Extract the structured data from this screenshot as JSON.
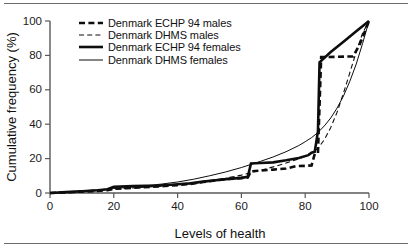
{
  "chart_data": {
    "type": "line",
    "title": "",
    "subtitle": "",
    "xlabel": "Levels of health",
    "ylabel": "Cumulative frequency (%)",
    "xlim": [
      0,
      100
    ],
    "ylim": [
      0,
      100
    ],
    "xticks": [
      0,
      20,
      40,
      60,
      80,
      100
    ],
    "yticks": [
      0,
      20,
      40,
      60,
      80,
      100
    ],
    "grid": false,
    "legend_position": "top-left",
    "colors": {
      "ink": "#0d0d0d",
      "axis": "#595959",
      "background": "#ffffff",
      "rule": "#6b6b6b"
    },
    "series": [
      {
        "name": "Denmark ECHP 94 males",
        "style": "thick-dashed",
        "linewidth": 2.6,
        "dash": "6 3.4",
        "points": [
          [
            0,
            0
          ],
          [
            5,
            0.4
          ],
          [
            10,
            0.8
          ],
          [
            15,
            1.2
          ],
          [
            18,
            1.6
          ],
          [
            20,
            2.4
          ],
          [
            24,
            2.8
          ],
          [
            28,
            3.2
          ],
          [
            32,
            3.6
          ],
          [
            36,
            4.1
          ],
          [
            40,
            4.6
          ],
          [
            44,
            5.2
          ],
          [
            48,
            6.4
          ],
          [
            52,
            7.4
          ],
          [
            55,
            8.0
          ],
          [
            58,
            8.4
          ],
          [
            62,
            9.0
          ],
          [
            63,
            12.6
          ],
          [
            66,
            13.0
          ],
          [
            70,
            13.6
          ],
          [
            74,
            14.2
          ],
          [
            77,
            15.6
          ],
          [
            80,
            15.8
          ],
          [
            82,
            16.0
          ],
          [
            83,
            22.8
          ],
          [
            84,
            23.2
          ],
          [
            85,
            79.0
          ],
          [
            90,
            79.2
          ],
          [
            95,
            79.4
          ],
          [
            97,
            86.0
          ],
          [
            100,
            100
          ]
        ]
      },
      {
        "name": "Denmark DHMS males",
        "style": "thin-dashed",
        "linewidth": 1.1,
        "dash": "5 3.2",
        "points": [
          [
            0,
            0
          ],
          [
            5,
            0.5
          ],
          [
            10,
            1.0
          ],
          [
            15,
            1.5
          ],
          [
            20,
            2.2
          ],
          [
            25,
            2.8
          ],
          [
            30,
            3.4
          ],
          [
            35,
            4.0
          ],
          [
            40,
            4.8
          ],
          [
            45,
            6.0
          ],
          [
            50,
            7.2
          ],
          [
            55,
            8.6
          ],
          [
            60,
            10.4
          ],
          [
            63,
            11.8
          ],
          [
            66,
            13.2
          ],
          [
            70,
            15.2
          ],
          [
            74,
            17.4
          ],
          [
            78,
            19.8
          ],
          [
            80,
            21.4
          ],
          [
            82,
            23.4
          ],
          [
            84,
            26.0
          ],
          [
            86,
            31.0
          ],
          [
            88,
            38.0
          ],
          [
            90,
            47.0
          ],
          [
            92,
            58.0
          ],
          [
            94,
            70.0
          ],
          [
            96,
            82.0
          ],
          [
            98,
            93.0
          ],
          [
            100,
            100
          ]
        ]
      },
      {
        "name": "Denmark ECHP 94 females",
        "style": "thick-solid",
        "linewidth": 2.6,
        "dash": "",
        "points": [
          [
            0,
            0
          ],
          [
            5,
            0.5
          ],
          [
            10,
            1.0
          ],
          [
            15,
            1.6
          ],
          [
            18,
            2.2
          ],
          [
            20,
            3.6
          ],
          [
            22,
            3.8
          ],
          [
            26,
            4.0
          ],
          [
            30,
            4.2
          ],
          [
            34,
            4.4
          ],
          [
            38,
            4.8
          ],
          [
            41,
            5.2
          ],
          [
            44,
            5.6
          ],
          [
            48,
            6.6
          ],
          [
            52,
            7.4
          ],
          [
            56,
            8.2
          ],
          [
            60,
            8.8
          ],
          [
            62,
            9.4
          ],
          [
            63,
            17.2
          ],
          [
            66,
            17.4
          ],
          [
            70,
            17.8
          ],
          [
            74,
            19.0
          ],
          [
            78,
            20.4
          ],
          [
            81,
            22.0
          ],
          [
            82,
            23.4
          ],
          [
            83,
            24.0
          ],
          [
            84,
            36.0
          ],
          [
            84.5,
            76.0
          ],
          [
            88,
            82.0
          ],
          [
            92,
            88.0
          ],
          [
            96,
            94.0
          ],
          [
            100,
            100
          ]
        ]
      },
      {
        "name": "Denmark DHMS females",
        "style": "thin-solid",
        "linewidth": 1.0,
        "dash": "",
        "points": [
          [
            0,
            0
          ],
          [
            5,
            0.6
          ],
          [
            10,
            1.2
          ],
          [
            15,
            1.8
          ],
          [
            20,
            2.6
          ],
          [
            25,
            3.4
          ],
          [
            30,
            4.2
          ],
          [
            35,
            5.2
          ],
          [
            40,
            6.4
          ],
          [
            45,
            8.0
          ],
          [
            50,
            10.0
          ],
          [
            55,
            12.2
          ],
          [
            60,
            14.8
          ],
          [
            63,
            16.6
          ],
          [
            66,
            18.4
          ],
          [
            70,
            21.0
          ],
          [
            74,
            24.0
          ],
          [
            78,
            27.6
          ],
          [
            80,
            29.8
          ],
          [
            82,
            32.2
          ],
          [
            84,
            35.2
          ],
          [
            86,
            39.0
          ],
          [
            88,
            43.6
          ],
          [
            90,
            49.4
          ],
          [
            92,
            56.4
          ],
          [
            94,
            65.0
          ],
          [
            96,
            75.0
          ],
          [
            98,
            87.0
          ],
          [
            100,
            100
          ]
        ]
      }
    ]
  },
  "legend": {
    "items": [
      {
        "label": "Denmark ECHP 94 males",
        "style": "thick-dashed"
      },
      {
        "label": "Denmark DHMS males",
        "style": "thin-dashed"
      },
      {
        "label": "Denmark ECHP 94 females",
        "style": "thick-solid"
      },
      {
        "label": "Denmark DHMS females",
        "style": "thin-solid"
      }
    ]
  }
}
